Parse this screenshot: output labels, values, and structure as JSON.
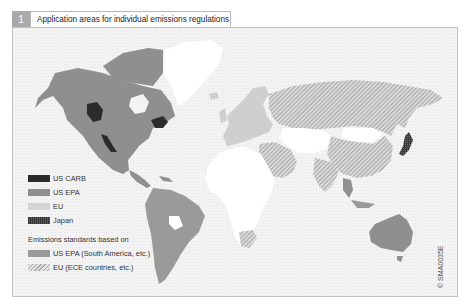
{
  "figure": {
    "number": "1",
    "title": "Application areas for individual emissions regulations",
    "credit_symbol": "©",
    "credit_code": "SMA0035E"
  },
  "colors": {
    "background_grid": "#f2f2f2",
    "us_carb": "#2b2b2b",
    "us_epa": "#8f8f8f",
    "eu": "#cfcfcf",
    "japan": "#3a3a3a",
    "based_on_us_epa": "#9a9a9a",
    "based_on_eu_hatch": "#b5b5b5",
    "unregulated": "#ffffff"
  },
  "legend": {
    "items": [
      {
        "label": "US CARB",
        "color": "#2b2b2b",
        "pattern": "solid"
      },
      {
        "label": "US EPA",
        "color": "#8f8f8f",
        "pattern": "solid"
      },
      {
        "label": "EU",
        "color": "#cfcfcf",
        "pattern": "solid"
      },
      {
        "label": "Japan",
        "color": "#3a3a3a",
        "pattern": "dotted"
      }
    ],
    "heading": "Emissions standards based on",
    "based_on": [
      {
        "label": "US EPA (South America, etc.)",
        "color": "#9a9a9a",
        "pattern": "solid"
      },
      {
        "label": "EU (ECE countries, etc.)",
        "color": "#b5b5b5",
        "pattern": "hatched"
      }
    ]
  },
  "map": {
    "regions": [
      {
        "name": "North America (USA/Canada)",
        "category": "US EPA"
      },
      {
        "name": "California / British Columbia / Northeast US",
        "category": "US CARB"
      },
      {
        "name": "Mexico / Central America",
        "category": "US EPA"
      },
      {
        "name": "South America",
        "category": "Based on US EPA"
      },
      {
        "name": "Europe",
        "category": "EU"
      },
      {
        "name": "Russia / China / India / Middle East / South Africa",
        "category": "Based on EU"
      },
      {
        "name": "Japan",
        "category": "Japan"
      },
      {
        "name": "Australia",
        "category": "Based on US EPA"
      },
      {
        "name": "Greenland / Africa / Central Asia / Mongolia",
        "category": "Unregulated"
      }
    ]
  }
}
